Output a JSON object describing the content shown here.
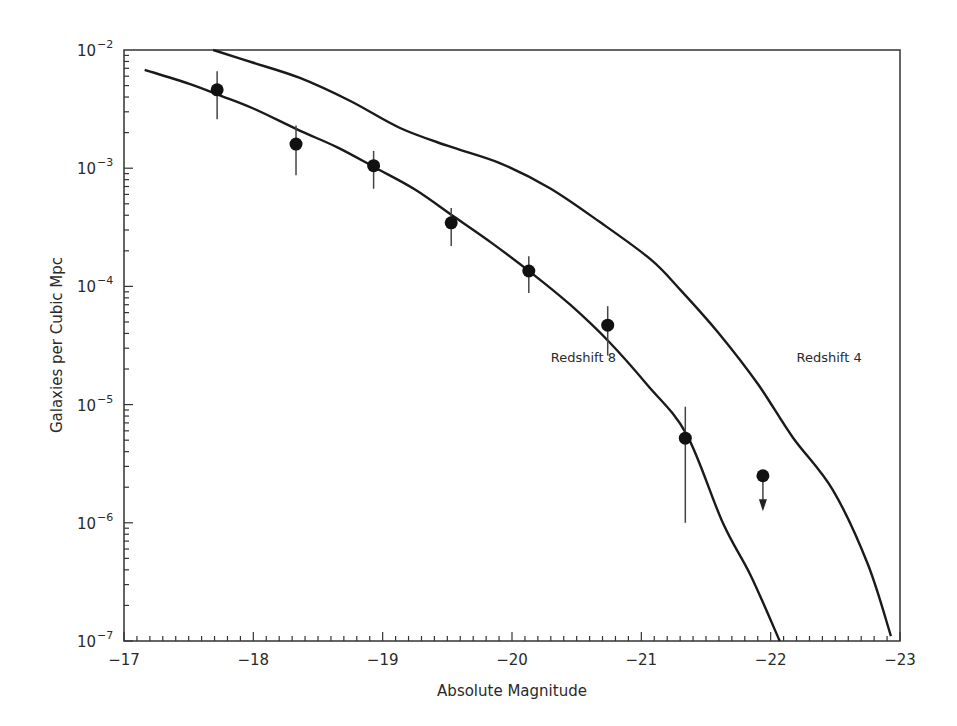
{
  "chart_data": {
    "type": "scatter",
    "title": "",
    "xlabel": "Absolute Magnitude",
    "ylabel": "Galaxies per Cubic Mpc",
    "xlim": [
      -17,
      -23
    ],
    "ylim": [
      1e-07,
      0.01
    ],
    "yscale": "log",
    "x_ticks": [
      -17,
      -18,
      -19,
      -20,
      -21,
      -22,
      -23
    ],
    "x_tick_labels": [
      "−17",
      "−18",
      "−19",
      "−20",
      "−21",
      "−22",
      "−23"
    ],
    "y_ticks": [
      -2,
      -3,
      -4,
      -5,
      -6,
      -7
    ],
    "y_tick_labels": [
      {
        "base": "10",
        "exp": "−2"
      },
      {
        "base": "10",
        "exp": "−3"
      },
      {
        "base": "10",
        "exp": "−4"
      },
      {
        "base": "10",
        "exp": "−5"
      },
      {
        "base": "10",
        "exp": "−6"
      },
      {
        "base": "10",
        "exp": "−7"
      }
    ],
    "grid": false,
    "legend": null,
    "series": [
      {
        "name": "Observed (Redshift 8)",
        "kind": "points",
        "x": [
          -17.72,
          -18.33,
          -18.93,
          -19.53,
          -20.13,
          -20.74,
          -21.34
        ],
        "y": [
          0.0046,
          0.0016,
          0.00105,
          0.000345,
          0.000135,
          4.7e-05,
          5.2e-06
        ],
        "y_err_low": [
          0.0026,
          0.00087,
          0.00067,
          0.00022,
          8.8e-05,
          2.6e-05,
          1e-06
        ],
        "y_err_high": [
          0.0066,
          0.0023,
          0.0014,
          0.00046,
          0.00018,
          6.8e-05,
          9.6e-06
        ]
      },
      {
        "name": "Upper limit",
        "kind": "upper_limit",
        "x": [
          -21.94
        ],
        "y": [
          2.5e-06
        ],
        "arrow_to": [
          1.3e-06
        ]
      },
      {
        "name": "Redshift 8",
        "kind": "line",
        "x": [
          -17.16,
          -17.5,
          -17.75,
          -18.0,
          -18.35,
          -18.65,
          -18.95,
          -19.25,
          -19.55,
          -19.85,
          -20.15,
          -20.45,
          -20.75,
          -21.05,
          -21.35,
          -21.63,
          -21.85,
          -22.07
        ],
        "y": [
          0.0068,
          0.0052,
          0.0041,
          0.0032,
          0.0021,
          0.0015,
          0.001,
          0.00066,
          0.00039,
          0.00023,
          0.00013,
          7e-05,
          3.4e-05,
          1.45e-05,
          5.6e-06,
          1e-06,
          3.5e-07,
          1e-07
        ]
      },
      {
        "name": "Redshift 4",
        "kind": "line",
        "x": [
          -17.69,
          -18.0,
          -18.36,
          -18.75,
          -19.13,
          -19.5,
          -19.91,
          -20.29,
          -20.68,
          -21.07,
          -21.3,
          -21.6,
          -21.9,
          -22.17,
          -22.48,
          -22.75,
          -22.93
        ],
        "y": [
          0.01,
          0.0078,
          0.0058,
          0.0037,
          0.0022,
          0.00155,
          0.0011,
          0.00068,
          0.00035,
          0.00017,
          9.4e-05,
          4e-05,
          1.5e-05,
          5.3e-06,
          1.9e-06,
          4.5e-07,
          1.1e-07
        ]
      }
    ],
    "annotations": [
      {
        "text": "Redshift 8",
        "x": -20.3,
        "y": 2.3e-05
      },
      {
        "text": "Redshift 4",
        "x": -22.2,
        "y": 2.3e-05
      }
    ]
  },
  "colors": {
    "ink": "#1a1a1a",
    "background": "#ffffff"
  }
}
